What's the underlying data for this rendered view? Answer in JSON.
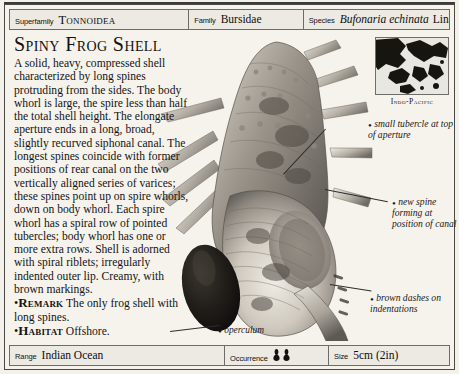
{
  "header": {
    "superfamily": {
      "label": "Superfamily",
      "value": "Tonnoidea"
    },
    "family": {
      "label": "Family",
      "value": "Bursidae"
    },
    "species": {
      "label": "Species",
      "value_italic": "Bufonaria echinata",
      "value_author": "Link"
    }
  },
  "title": "Spiny Frog Shell",
  "description": {
    "paragraph": "A solid, heavy, compressed shell characterized by long spines protruding from the sides. The body whorl is large, the spire less than half the total shell height. The elongate aperture ends in a long, broad, slightly recurved siphonal canal. The longest spines coincide with former positions of rear canal on the two vertically aligned series of varices; these spines point up on spire whorls, down on body whorl. Each spire whorl has a spiral row of pointed tubercles; body whorl has one or more extra rows. Shell is adorned with spiral riblets; irregularly indented outer lip. Creamy, with brown markings.",
    "bullets": [
      {
        "bullet": "•",
        "keyword": "Remark",
        "text": "The only frog shell with long spines."
      },
      {
        "bullet": "•",
        "keyword": "Habitat",
        "text": "Offshore."
      }
    ]
  },
  "map": {
    "caption": "Indo-Pacific"
  },
  "callouts": [
    {
      "name": "tubercle",
      "dot": "•",
      "text": "small tubercle at top of aperture"
    },
    {
      "name": "new-spine",
      "dot": "•",
      "text": "new spine forming at position of canal"
    },
    {
      "name": "brown-dashes",
      "dot": "•",
      "text": "brown dashes on indentations"
    },
    {
      "name": "operculum",
      "dot": "•",
      "text": "operculum"
    }
  ],
  "footer": {
    "range": {
      "label": "Range",
      "value": "Indian Ocean"
    },
    "occurrence": {
      "label": "Occurrence",
      "icon_count": 2,
      "icon": "shell-icon"
    },
    "size": {
      "label": "Size",
      "value": "5cm (2in)"
    }
  },
  "colors": {
    "page_background": "#f4f1eb",
    "frame": "#4a4a48",
    "rule": "#6c6c68",
    "text": "#141414",
    "band_fill": "#eceae3"
  }
}
